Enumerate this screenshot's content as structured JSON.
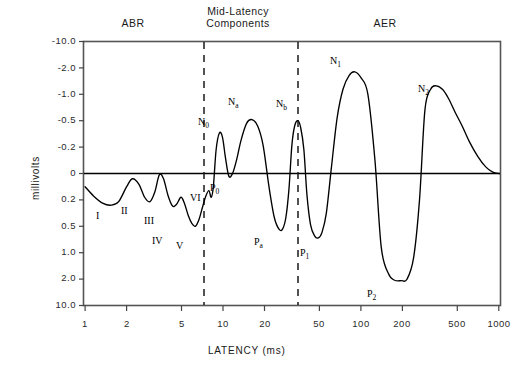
{
  "figure": {
    "y_axis_label": "millivolts",
    "x_axis_label": "LATENCY (ms)"
  },
  "headers": [
    {
      "id": "abr",
      "label": "ABR"
    },
    {
      "id": "mid-latency",
      "line1": "Mid-Latency",
      "line2": "Components"
    },
    {
      "id": "aer",
      "label": "AER"
    }
  ],
  "chart_data": {
    "type": "line",
    "title": "",
    "xlabel": "LATENCY (ms)",
    "ylabel": "millivolts",
    "x_scale": "log",
    "xlim": [
      1,
      1400
    ],
    "xticks": [
      1,
      2,
      5,
      10,
      20,
      50,
      100,
      200,
      500,
      1000
    ],
    "xtick_labels": [
      "1",
      "2",
      "5",
      "10",
      "20",
      "50",
      "100",
      "200",
      "500",
      "1000"
    ],
    "y_scale": "inverted-pseudo-log",
    "yticks": [
      -10.0,
      -2.0,
      -1.0,
      -0.5,
      -0.2,
      0,
      0.2,
      0.5,
      1.0,
      2.0,
      10.0
    ],
    "ytick_labels": [
      "-10.0",
      "-2.0",
      "-1.0",
      "-0.5",
      "-0.2",
      "0",
      "0.2",
      "0.5",
      "1.0",
      "2.0",
      "10.0"
    ],
    "grid": false,
    "legend": "none",
    "zero_line": 0,
    "dividers": [
      {
        "id": "divider-abr-mid",
        "x": 8,
        "style": "dashed"
      },
      {
        "id": "divider-mid-aer",
        "x": 40,
        "style": "dashed"
      }
    ],
    "series": [
      {
        "name": "Auditory evoked potential waveform",
        "points": [
          [
            1.0,
            0.1
          ],
          [
            1.15,
            0.17
          ],
          [
            1.35,
            0.24
          ],
          [
            1.55,
            0.26
          ],
          [
            1.75,
            0.22
          ],
          [
            2.0,
            0.1
          ],
          [
            2.2,
            0.04
          ],
          [
            2.45,
            0.08
          ],
          [
            2.7,
            0.18
          ],
          [
            2.95,
            0.22
          ],
          [
            3.2,
            0.14
          ],
          [
            3.45,
            0.01
          ],
          [
            3.7,
            0.04
          ],
          [
            4.0,
            0.17
          ],
          [
            4.3,
            0.27
          ],
          [
            4.6,
            0.25
          ],
          [
            4.95,
            0.18
          ],
          [
            5.25,
            0.24
          ],
          [
            5.6,
            0.38
          ],
          [
            5.95,
            0.47
          ],
          [
            6.3,
            0.5
          ],
          [
            6.7,
            0.42
          ],
          [
            7.1,
            0.28
          ],
          [
            7.5,
            0.17
          ],
          [
            7.9,
            0.13
          ],
          [
            8.2,
            0.18
          ],
          [
            8.5,
            0.1
          ],
          [
            8.9,
            -0.18
          ],
          [
            9.4,
            -0.36
          ],
          [
            9.9,
            -0.31
          ],
          [
            10.4,
            -0.12
          ],
          [
            11.0,
            0.02
          ],
          [
            11.7,
            0.0
          ],
          [
            12.5,
            -0.1
          ],
          [
            13.5,
            -0.28
          ],
          [
            14.8,
            -0.47
          ],
          [
            16.2,
            -0.52
          ],
          [
            17.8,
            -0.44
          ],
          [
            19.5,
            -0.22
          ],
          [
            21.5,
            0.1
          ],
          [
            23.5,
            0.4
          ],
          [
            25.5,
            0.56
          ],
          [
            27.0,
            0.55
          ],
          [
            28.5,
            0.4
          ],
          [
            30.0,
            0.12
          ],
          [
            31.5,
            -0.22
          ],
          [
            33.0,
            -0.44
          ],
          [
            34.8,
            -0.5
          ],
          [
            36.5,
            -0.42
          ],
          [
            38.5,
            -0.18
          ],
          [
            40.5,
            0.16
          ],
          [
            43.0,
            0.48
          ],
          [
            46.0,
            0.68
          ],
          [
            49.0,
            0.72
          ],
          [
            52.0,
            0.62
          ],
          [
            56.0,
            0.35
          ],
          [
            61.0,
            -0.05
          ],
          [
            67.0,
            -0.55
          ],
          [
            74.0,
            -1.2
          ],
          [
            82.0,
            -1.72
          ],
          [
            90.0,
            -1.85
          ],
          [
            100.0,
            -1.62
          ],
          [
            112.0,
            -1.0
          ],
          [
            126.0,
            -0.1
          ],
          [
            140.0,
            0.9
          ],
          [
            158.0,
            1.8
          ],
          [
            175.0,
            2.35
          ],
          [
            195.0,
            2.45
          ],
          [
            215.0,
            2.05
          ],
          [
            240.0,
            1.2
          ],
          [
            265.0,
            0.2
          ],
          [
            290.0,
            -0.7
          ],
          [
            320.0,
            -1.2
          ],
          [
            350.0,
            -1.32
          ],
          [
            390.0,
            -1.18
          ],
          [
            430.0,
            -0.92
          ],
          [
            480.0,
            -0.66
          ],
          [
            540.0,
            -0.44
          ],
          [
            610.0,
            -0.26
          ],
          [
            700.0,
            -0.13
          ],
          [
            800.0,
            -0.05
          ],
          [
            900.0,
            -0.01
          ],
          [
            1000.0,
            0.0
          ]
        ]
      }
    ],
    "annotations": [
      {
        "id": "peak-I",
        "text": "I",
        "x": 1.55,
        "y": 0.26
      },
      {
        "id": "peak-II",
        "text": "II",
        "x": 2.95,
        "y": 0.22
      },
      {
        "id": "peak-III",
        "text": "III",
        "x": 4.3,
        "y": 0.27
      },
      {
        "id": "peak-IV",
        "text": "IV",
        "x": 4.95,
        "y": 0.18
      },
      {
        "id": "peak-V",
        "text": "V",
        "x": 6.3,
        "y": 0.5
      },
      {
        "id": "peak-VI",
        "text": "VI",
        "x": 7.9,
        "y": 0.13
      },
      {
        "id": "peak-N0",
        "text": "N",
        "sub": "0",
        "x": 9.4,
        "y": -0.36
      },
      {
        "id": "peak-P0",
        "text": "P",
        "sub": "0",
        "x": 11.7,
        "y": 0.0
      },
      {
        "id": "peak-Na",
        "text": "N",
        "sub": "a",
        "x": 16.2,
        "y": -0.52
      },
      {
        "id": "peak-Pa",
        "text": "P",
        "sub": "a",
        "x": 26.0,
        "y": 0.56
      },
      {
        "id": "peak-Nb",
        "text": "N",
        "sub": "b",
        "x": 34.8,
        "y": -0.5
      },
      {
        "id": "peak-P1",
        "text": "P",
        "sub": "1",
        "x": 49.0,
        "y": 0.72
      },
      {
        "id": "peak-N1",
        "text": "N",
        "sub": "1",
        "x": 90.0,
        "y": -1.85
      },
      {
        "id": "peak-P2",
        "text": "P",
        "sub": "2",
        "x": 195.0,
        "y": 2.45
      },
      {
        "id": "peak-N2",
        "text": "N",
        "sub": "2",
        "x": 350.0,
        "y": -1.32
      }
    ]
  }
}
